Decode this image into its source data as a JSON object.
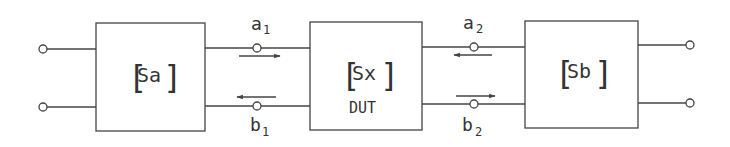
{
  "diagram": {
    "blocks": [
      {
        "id": "sa",
        "label": "Sa",
        "sublabel": ""
      },
      {
        "id": "sx",
        "label": "Sx",
        "sublabel": "DUT"
      },
      {
        "id": "sb",
        "label": "Sb",
        "sublabel": ""
      }
    ],
    "waves": {
      "a1": {
        "base": "a",
        "sub": "1"
      },
      "b1": {
        "base": "b",
        "sub": "1"
      },
      "a2": {
        "base": "a",
        "sub": "2"
      },
      "b2": {
        "base": "b",
        "sub": "2"
      }
    },
    "colors": {
      "line": "#444444",
      "text": "#333333",
      "background": "#ffffff"
    }
  }
}
